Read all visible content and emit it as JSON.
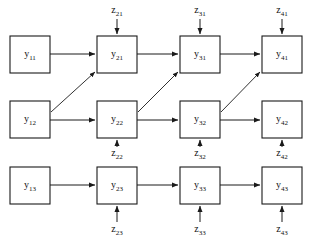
{
  "diagram": {
    "type": "grid-lattice",
    "stroke_color": "#1a1a1a",
    "background_color": "#ffffff",
    "rows": 3,
    "columns": 4,
    "nodes": [
      {
        "id": "y11",
        "base": "y",
        "subscript": "11",
        "row": 1,
        "col": 1,
        "x": 10,
        "y": 36,
        "w": 40,
        "h": 37
      },
      {
        "id": "y21",
        "base": "y",
        "subscript": "21",
        "row": 1,
        "col": 2,
        "x": 97,
        "y": 36,
        "w": 40,
        "h": 37
      },
      {
        "id": "y31",
        "base": "y",
        "subscript": "31",
        "row": 1,
        "col": 3,
        "x": 180,
        "y": 36,
        "w": 40,
        "h": 37
      },
      {
        "id": "y41",
        "base": "y",
        "subscript": "41",
        "row": 1,
        "col": 4,
        "x": 262,
        "y": 36,
        "w": 40,
        "h": 37
      },
      {
        "id": "y12",
        "base": "y",
        "subscript": "12",
        "row": 2,
        "col": 1,
        "x": 10,
        "y": 101,
        "w": 40,
        "h": 37
      },
      {
        "id": "y22",
        "base": "y",
        "subscript": "22",
        "row": 2,
        "col": 2,
        "x": 97,
        "y": 101,
        "w": 40,
        "h": 37
      },
      {
        "id": "y32",
        "base": "y",
        "subscript": "32",
        "row": 2,
        "col": 3,
        "x": 180,
        "y": 101,
        "w": 40,
        "h": 37
      },
      {
        "id": "y42",
        "base": "y",
        "subscript": "42",
        "row": 2,
        "col": 4,
        "x": 262,
        "y": 101,
        "w": 40,
        "h": 37
      },
      {
        "id": "y13",
        "base": "y",
        "subscript": "13",
        "row": 3,
        "col": 1,
        "x": 10,
        "y": 167,
        "w": 40,
        "h": 37
      },
      {
        "id": "y23",
        "base": "y",
        "subscript": "23",
        "row": 3,
        "col": 2,
        "x": 97,
        "y": 167,
        "w": 40,
        "h": 37
      },
      {
        "id": "y33",
        "base": "y",
        "subscript": "33",
        "row": 3,
        "col": 3,
        "x": 180,
        "y": 167,
        "w": 40,
        "h": 37
      },
      {
        "id": "y43",
        "base": "y",
        "subscript": "43",
        "row": 3,
        "col": 4,
        "x": 262,
        "y": 167,
        "w": 40,
        "h": 37
      }
    ],
    "sources": [
      {
        "id": "z21",
        "base": "z",
        "subscript": "21",
        "label_x": 117,
        "label_y": 11,
        "arrow_x": 117,
        "arrow_y1": 19,
        "arrow_y2": 34,
        "direction": "down",
        "target": "y21"
      },
      {
        "id": "z31",
        "base": "z",
        "subscript": "31",
        "label_x": 200,
        "label_y": 11,
        "arrow_x": 200,
        "arrow_y1": 19,
        "arrow_y2": 34,
        "direction": "down",
        "target": "y31"
      },
      {
        "id": "z41",
        "base": "z",
        "subscript": "41",
        "label_x": 282,
        "label_y": 11,
        "arrow_x": 282,
        "arrow_y1": 19,
        "arrow_y2": 34,
        "direction": "down",
        "target": "y41"
      },
      {
        "id": "z22",
        "base": "z",
        "subscript": "22",
        "label_x": 117,
        "label_y": 154,
        "arrow_x": 117,
        "arrow_y1": 147,
        "arrow_y2": 140,
        "direction": "up",
        "target": "y22"
      },
      {
        "id": "z32",
        "base": "z",
        "subscript": "32",
        "label_x": 200,
        "label_y": 154,
        "arrow_x": 200,
        "arrow_y1": 147,
        "arrow_y2": 140,
        "direction": "up",
        "target": "y32"
      },
      {
        "id": "z42",
        "base": "z",
        "subscript": "42",
        "label_x": 282,
        "label_y": 154,
        "arrow_x": 282,
        "arrow_y1": 147,
        "arrow_y2": 140,
        "direction": "up",
        "target": "y42"
      },
      {
        "id": "z23",
        "base": "z",
        "subscript": "23",
        "label_x": 117,
        "label_y": 230,
        "arrow_x": 117,
        "arrow_y1": 222,
        "arrow_y2": 206,
        "direction": "up",
        "target": "y23"
      },
      {
        "id": "z33",
        "base": "z",
        "subscript": "33",
        "label_x": 200,
        "label_y": 230,
        "arrow_x": 200,
        "arrow_y1": 222,
        "arrow_y2": 206,
        "direction": "up",
        "target": "y33"
      },
      {
        "id": "z43",
        "base": "z",
        "subscript": "43",
        "label_x": 282,
        "label_y": 230,
        "arrow_x": 282,
        "arrow_y1": 222,
        "arrow_y2": 206,
        "direction": "up",
        "target": "y43"
      }
    ],
    "horizontal_edges": [
      {
        "from": "y11",
        "to": "y21",
        "x1": 50,
        "y1": 54,
        "x2": 95,
        "y2": 54
      },
      {
        "from": "y21",
        "to": "y31",
        "x1": 137,
        "y1": 54,
        "x2": 178,
        "y2": 54
      },
      {
        "from": "y31",
        "to": "y41",
        "x1": 220,
        "y1": 54,
        "x2": 260,
        "y2": 54
      },
      {
        "from": "y12",
        "to": "y22",
        "x1": 50,
        "y1": 120,
        "x2": 95,
        "y2": 120
      },
      {
        "from": "y22",
        "to": "y32",
        "x1": 137,
        "y1": 120,
        "x2": 178,
        "y2": 120
      },
      {
        "from": "y32",
        "to": "y42",
        "x1": 220,
        "y1": 120,
        "x2": 260,
        "y2": 120
      },
      {
        "from": "y13",
        "to": "y23",
        "x1": 50,
        "y1": 185,
        "x2": 95,
        "y2": 185
      },
      {
        "from": "y23",
        "to": "y33",
        "x1": 137,
        "y1": 185,
        "x2": 178,
        "y2": 185
      },
      {
        "from": "y33",
        "to": "y43",
        "x1": 220,
        "y1": 185,
        "x2": 260,
        "y2": 185
      }
    ],
    "diagonal_edges": [
      {
        "from": "y12",
        "to": "y21",
        "x1": 51,
        "y1": 112,
        "x2": 95,
        "y2": 72
      },
      {
        "from": "y22",
        "to": "y31",
        "x1": 138,
        "y1": 112,
        "x2": 178,
        "y2": 72
      },
      {
        "from": "y32",
        "to": "y41",
        "x1": 221,
        "y1": 112,
        "x2": 260,
        "y2": 72
      }
    ]
  }
}
